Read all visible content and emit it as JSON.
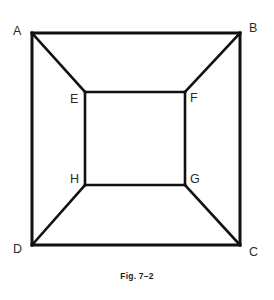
{
  "figure": {
    "caption": "Fig. 7–2",
    "stroke_color": "#111111",
    "background_color": "#ffffff",
    "outer_stroke_width": 3,
    "inner_stroke_width": 2.6,
    "diagonal_stroke_width": 2.6,
    "outer_square": {
      "name": "ABCD",
      "vertices": [
        {
          "id": "A",
          "label": "A",
          "x": 32,
          "y": 33
        },
        {
          "id": "B",
          "label": "B",
          "x": 240,
          "y": 33
        },
        {
          "id": "C",
          "label": "C",
          "x": 240,
          "y": 245
        },
        {
          "id": "D",
          "label": "D",
          "x": 32,
          "y": 245
        }
      ]
    },
    "inner_square": {
      "name": "EFGH",
      "vertices": [
        {
          "id": "E",
          "label": "E",
          "x": 85,
          "y": 92
        },
        {
          "id": "F",
          "label": "F",
          "x": 185,
          "y": 92
        },
        {
          "id": "G",
          "label": "G",
          "x": 185,
          "y": 185
        },
        {
          "id": "H",
          "label": "H",
          "x": 85,
          "y": 185
        }
      ]
    },
    "diagonals": [
      {
        "from": "A",
        "to": "E"
      },
      {
        "from": "B",
        "to": "F"
      },
      {
        "from": "C",
        "to": "G"
      },
      {
        "from": "D",
        "to": "H"
      }
    ]
  }
}
